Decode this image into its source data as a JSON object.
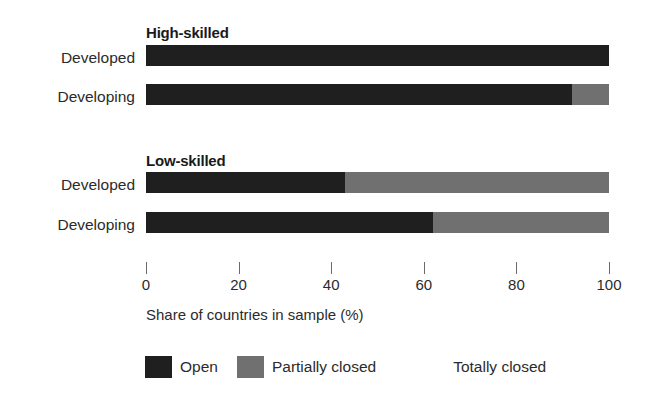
{
  "chart_data": {
    "type": "bar",
    "orientation": "horizontal",
    "stacked": true,
    "title": "",
    "xlabel": "Share of countries in sample (%)",
    "ylabel": "",
    "xlim": [
      0,
      100
    ],
    "xticks": [
      0,
      20,
      40,
      60,
      80,
      100
    ],
    "xticklabels": [
      "0",
      "20",
      "40",
      "60",
      "80",
      "100"
    ],
    "grid": false,
    "legend_position": "bottom",
    "series": [
      {
        "name": "Open",
        "color": "#1f1f1f",
        "values": [
          100,
          92,
          43,
          62
        ]
      },
      {
        "name": "Partially closed",
        "color": "#707070",
        "values": [
          0,
          8,
          57,
          38
        ]
      },
      {
        "name": "Totally closed",
        "color": "#ffffff",
        "values": [
          0,
          0,
          0,
          0
        ]
      }
    ],
    "categories": [
      "Developed",
      "Developing",
      "Developed",
      "Developing"
    ],
    "groups": [
      {
        "title": "High-skilled",
        "rows": [
          {
            "label": "Developed",
            "open": 100,
            "partially_closed": 0,
            "totally_closed": 0
          },
          {
            "label": "Developing",
            "open": 92,
            "partially_closed": 8,
            "totally_closed": 0
          }
        ]
      },
      {
        "title": "Low-skilled",
        "rows": [
          {
            "label": "Developed",
            "open": 43,
            "partially_closed": 57,
            "totally_closed": 0
          },
          {
            "label": "Developing",
            "open": 62,
            "partially_closed": 38,
            "totally_closed": 0
          }
        ]
      }
    ]
  },
  "axis": {
    "label": "Share of countries in sample (%)",
    "ticks": [
      "0",
      "20",
      "40",
      "60",
      "80",
      "100"
    ]
  },
  "legend": {
    "items": [
      {
        "label": "Open",
        "color": "#1f1f1f"
      },
      {
        "label": "Partially closed",
        "color": "#707070"
      },
      {
        "label": "Totally closed",
        "color": "#ffffff"
      }
    ]
  },
  "groups": {
    "high": {
      "title": "High-skilled"
    },
    "low": {
      "title": "Low-skilled"
    }
  },
  "rows": {
    "r0": {
      "label": "Developed"
    },
    "r1": {
      "label": "Developing"
    },
    "r2": {
      "label": "Developed"
    },
    "r3": {
      "label": "Developing"
    }
  },
  "colors": {
    "open": "#1f1f1f",
    "partially_closed": "#707070",
    "totally_closed": "#ffffff",
    "text": "#2b2b2b",
    "tick": "#6a6a6a",
    "background": "#ffffff"
  }
}
